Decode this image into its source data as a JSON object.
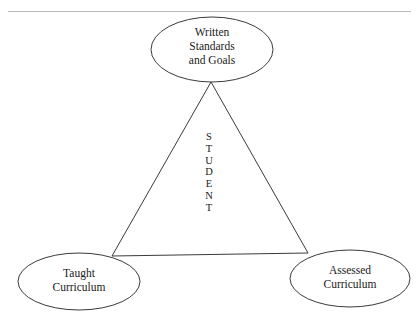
{
  "diagram": {
    "type": "triangle-relationship",
    "background_color": "#ffffff",
    "stroke_color": "#3a3a3a",
    "text_color": "#1a1a1a",
    "top_rule": {
      "name": "top-divider-rule",
      "color": "#b9b9b9"
    },
    "center_label": {
      "text": "STUDENT",
      "orientation": "vertical",
      "letters": [
        "S",
        "T",
        "U",
        "D",
        "E",
        "N",
        "T"
      ]
    },
    "nodes": [
      {
        "id": "written-standards-and-goals",
        "label_line1": "Written",
        "label_line2": "Standards",
        "label_line3": "and Goals",
        "position": "top"
      },
      {
        "id": "taught-curriculum",
        "label_line1": "Taught",
        "label_line2": "Curriculum",
        "label_line3": "",
        "position": "bottom-left"
      },
      {
        "id": "assessed-curriculum",
        "label_line1": "Assessed",
        "label_line2": "Curriculum",
        "label_line3": "",
        "position": "bottom-right"
      }
    ],
    "connections": [
      {
        "from": "written-standards-and-goals",
        "to": "taught-curriculum"
      },
      {
        "from": "written-standards-and-goals",
        "to": "assessed-curriculum"
      },
      {
        "from": "taught-curriculum",
        "to": "assessed-curriculum"
      }
    ]
  }
}
